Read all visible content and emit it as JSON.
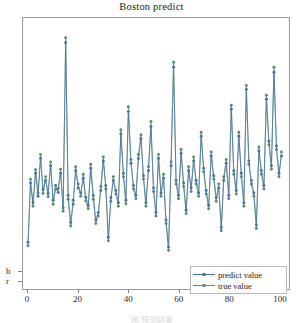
{
  "figure": {
    "title": "Boston predict",
    "bottom_caption": "图 预测结果"
  },
  "legend": {
    "position": "lower-right",
    "items": [
      {
        "label": "predict value",
        "color": "#4573a7",
        "marker": "dot"
      },
      {
        "label": "true value",
        "color": "#5f8f6a",
        "marker": "dot"
      }
    ]
  },
  "axes": {
    "x_ticks": [
      "0",
      "20",
      "40",
      "60",
      "80",
      "100"
    ],
    "y_ticks": [
      "b",
      "r"
    ],
    "xlabel": "",
    "ylabel": ""
  },
  "chart_data": {
    "type": "line",
    "title": "Boston predict",
    "xlabel": "",
    "ylabel": "",
    "grid": false,
    "legend_position": "lower right",
    "xlim": [
      -2,
      104
    ],
    "ylim": [
      0,
      55
    ],
    "x_ticks": [
      0,
      20,
      40,
      60,
      80,
      100
    ],
    "x": [
      0,
      1,
      2,
      3,
      4,
      5,
      6,
      7,
      8,
      9,
      10,
      11,
      12,
      13,
      14,
      15,
      16,
      17,
      18,
      19,
      20,
      21,
      22,
      23,
      24,
      25,
      26,
      27,
      28,
      29,
      30,
      31,
      32,
      33,
      34,
      35,
      36,
      37,
      38,
      39,
      40,
      41,
      42,
      43,
      44,
      45,
      46,
      47,
      48,
      49,
      50,
      51,
      52,
      53,
      54,
      55,
      56,
      57,
      58,
      59,
      60,
      61,
      62,
      63,
      64,
      65,
      66,
      67,
      68,
      69,
      70,
      71,
      72,
      73,
      74,
      75,
      76,
      77,
      78,
      79,
      80,
      81,
      82,
      83,
      84,
      85,
      86,
      87,
      88,
      89,
      90,
      91,
      92,
      93,
      94,
      95,
      96,
      97,
      98,
      99,
      100,
      101
    ],
    "series": [
      {
        "name": "predict value",
        "color": "#4573a7",
        "marker": "dot",
        "values": [
          9.5,
          21.5,
          17.5,
          23.5,
          18.8,
          26.5,
          20.2,
          22.0,
          19.4,
          25.0,
          18.0,
          21.0,
          19.6,
          23.5,
          16.5,
          50.0,
          19.0,
          13.5,
          18.0,
          24.0,
          20.5,
          19.5,
          22.5,
          18.6,
          17.0,
          24.5,
          19.0,
          14.0,
          15.5,
          20.0,
          26.0,
          21.0,
          10.5,
          18.5,
          22.0,
          20.0,
          17.5,
          31.5,
          23.5,
          18.0,
          36.0,
          25.5,
          21.0,
          19.0,
          26.5,
          30.5,
          23.0,
          17.5,
          24.0,
          33.0,
          20.5,
          15.5,
          26.5,
          19.5,
          22.5,
          14.0,
          8.5,
          25.0,
          45.0,
          22.0,
          19.0,
          27.5,
          21.5,
          16.0,
          24.0,
          20.5,
          26.0,
          22.0,
          19.5,
          31.0,
          24.5,
          20.0,
          17.0,
          27.0,
          23.0,
          18.5,
          20.5,
          12.5,
          22.0,
          25.5,
          19.0,
          36.5,
          24.0,
          20.0,
          31.0,
          23.5,
          17.5,
          40.5,
          26.0,
          22.0,
          19.5,
          13.0,
          28.0,
          24.0,
          21.0,
          38.5,
          30.0,
          25.0,
          44.0,
          29.0,
          23.5,
          27.0
        ]
      },
      {
        "name": "true value",
        "color": "#5f8f6a",
        "marker": "dot",
        "values": [
          8.8,
          22.3,
          16.8,
          24.2,
          19.5,
          27.3,
          19.4,
          22.8,
          18.7,
          25.8,
          17.2,
          20.2,
          20.4,
          24.3,
          15.8,
          51.0,
          18.2,
          12.8,
          17.2,
          24.8,
          21.3,
          18.8,
          23.3,
          17.9,
          16.3,
          25.3,
          18.2,
          13.3,
          14.8,
          20.8,
          26.8,
          20.3,
          9.8,
          17.8,
          22.8,
          19.3,
          16.8,
          32.3,
          22.8,
          17.3,
          37.0,
          26.3,
          20.3,
          18.3,
          27.3,
          31.3,
          22.3,
          16.8,
          24.8,
          34.0,
          19.8,
          14.8,
          27.3,
          18.8,
          23.3,
          13.3,
          7.8,
          25.8,
          46.0,
          21.3,
          18.3,
          28.3,
          20.8,
          15.3,
          24.8,
          19.8,
          26.8,
          21.3,
          18.8,
          31.8,
          23.8,
          19.3,
          16.3,
          27.8,
          22.3,
          17.8,
          21.3,
          11.8,
          22.8,
          26.3,
          18.3,
          37.3,
          23.3,
          19.3,
          31.8,
          22.8,
          16.8,
          41.3,
          25.3,
          21.3,
          18.8,
          12.3,
          28.8,
          23.3,
          20.3,
          39.3,
          29.3,
          24.3,
          45.0,
          28.3,
          22.8,
          27.8
        ]
      }
    ]
  }
}
